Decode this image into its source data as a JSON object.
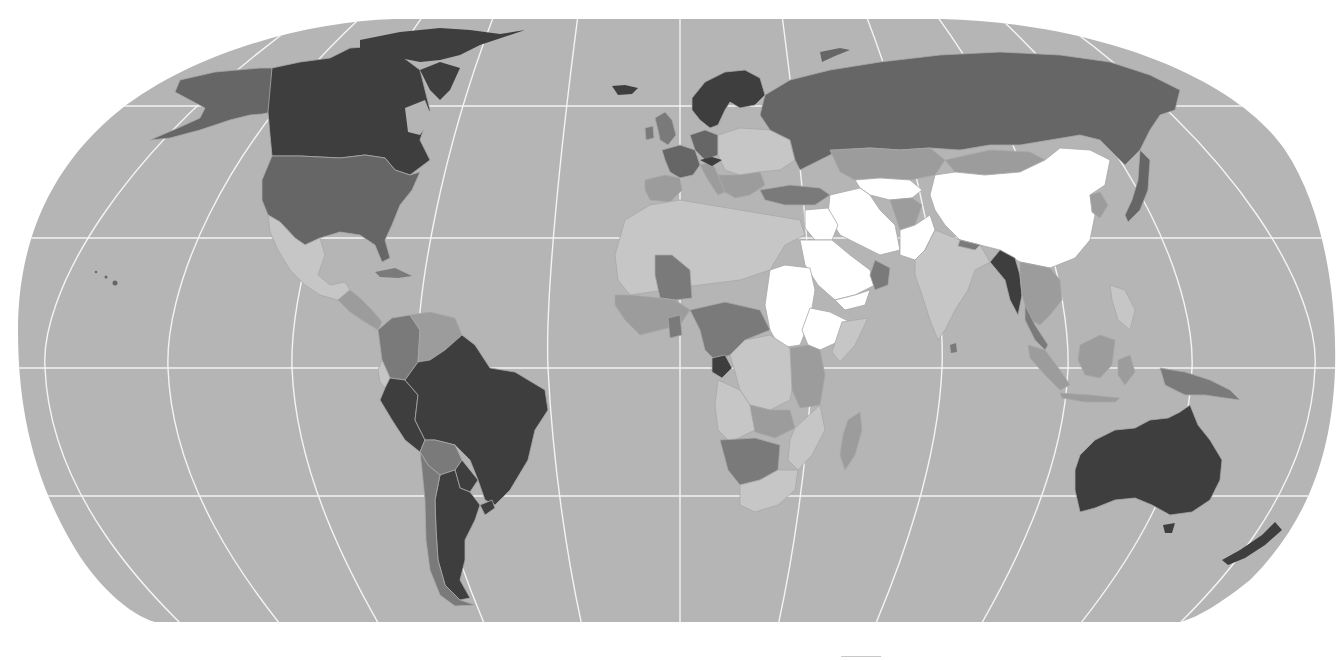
{
  "map": {
    "type": "choropleth",
    "projection": "robinson",
    "colorscale": "grayscale",
    "title": "",
    "labels_visible": false,
    "colors": {
      "background": "#ffffff",
      "ocean": "#b5b5b5",
      "graticule": "#f4f4f4",
      "border": "#a8a8a8",
      "class_white": "#ffffff",
      "class_light": "#c6c6c6",
      "class_mid_light": "#9c9c9c",
      "class_mid": "#7a7a7a",
      "class_dark": "#666666",
      "class_darkest": "#3e3e3e"
    },
    "regions": [
      {
        "name": "Canada",
        "class": "darkest"
      },
      {
        "name": "Greenland/Arctic islands",
        "class": "darkest"
      },
      {
        "name": "Alaska",
        "class": "dark"
      },
      {
        "name": "United States",
        "class": "dark"
      },
      {
        "name": "Mexico",
        "class": "light"
      },
      {
        "name": "Central America",
        "class": "mid_light"
      },
      {
        "name": "Colombia",
        "class": "mid"
      },
      {
        "name": "Venezuela",
        "class": "mid_light"
      },
      {
        "name": "Brazil",
        "class": "darkest"
      },
      {
        "name": "Peru",
        "class": "darkest"
      },
      {
        "name": "Bolivia",
        "class": "mid"
      },
      {
        "name": "Argentina",
        "class": "darkest"
      },
      {
        "name": "Chile",
        "class": "mid"
      },
      {
        "name": "Iceland",
        "class": "darkest"
      },
      {
        "name": "Scandinavia",
        "class": "darkest"
      },
      {
        "name": "Western Europe",
        "class": "dark"
      },
      {
        "name": "Eastern Europe",
        "class": "light"
      },
      {
        "name": "Russia",
        "class": "dark"
      },
      {
        "name": "Kazakhstan",
        "class": "mid_light"
      },
      {
        "name": "China",
        "class": "white"
      },
      {
        "name": "Iran",
        "class": "white"
      },
      {
        "name": "Saudi Arabia",
        "class": "white"
      },
      {
        "name": "Pakistan",
        "class": "white"
      },
      {
        "name": "Sudan",
        "class": "white"
      },
      {
        "name": "Ethiopia",
        "class": "white"
      },
      {
        "name": "India",
        "class": "light"
      },
      {
        "name": "Myanmar",
        "class": "darkest"
      },
      {
        "name": "Southeast Asia",
        "class": "mid_light"
      },
      {
        "name": "Japan",
        "class": "dark"
      },
      {
        "name": "Indonesia",
        "class": "mid_light"
      },
      {
        "name": "Papua New Guinea",
        "class": "mid"
      },
      {
        "name": "North Africa",
        "class": "light"
      },
      {
        "name": "Mali",
        "class": "mid"
      },
      {
        "name": "Central Africa (Congo)",
        "class": "mid"
      },
      {
        "name": "Gabon",
        "class": "darkest"
      },
      {
        "name": "Southern Africa",
        "class": "light"
      },
      {
        "name": "Namibia/Botswana",
        "class": "mid"
      },
      {
        "name": "Madagascar",
        "class": "mid_light"
      },
      {
        "name": "Australia",
        "class": "darkest"
      },
      {
        "name": "New Zealand",
        "class": "darkest"
      }
    ],
    "graticule": {
      "parallels_y": [
        106,
        238,
        368,
        496
      ],
      "meridian_count": 13
    }
  }
}
